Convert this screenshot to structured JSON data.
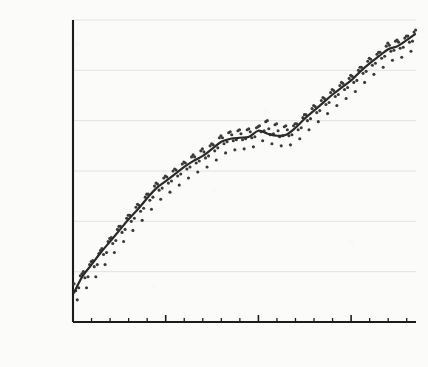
{
  "chart_data": {
    "type": "scatter",
    "title": "",
    "subtitle": "",
    "xlabel": "",
    "ylabel": "PARTS PER BILLION (PPB)",
    "xlim": [
      1983,
      2020
    ],
    "ylim": [
      1600,
      1900
    ],
    "xticks": [
      1983,
      1985,
      1987,
      1989,
      1991,
      1993,
      1995,
      1997,
      1999,
      2001,
      2003,
      2005,
      2007,
      2009,
      2011,
      2013,
      2015,
      2017,
      2019
    ],
    "xticklabels": [
      "1983",
      "",
      "",
      "",
      "",
      "1993",
      "",
      "",
      "",
      "",
      "2003",
      "",
      "",
      "",
      "",
      "2013",
      "",
      "",
      ""
    ],
    "yticks": [
      1600,
      1650,
      1700,
      1750,
      1800,
      1850,
      1900
    ],
    "yticklabels": [
      "1600",
      "1650",
      "1700",
      "1750",
      "1800",
      "1850",
      "1900"
    ],
    "grid": "horizontal",
    "legend": "none",
    "colors": {
      "background": "#fbfbfa",
      "axis": "#1c1c1c",
      "gridline": "#e2e2e2",
      "trend_line": "#2a2a2a",
      "scatter_point": "#3a3a3a",
      "tick_label": "#1c1c1c"
    },
    "series": [
      {
        "name": "Monthly mean",
        "kind": "scatter",
        "x": [
          1983.12,
          1983.29,
          1983.46,
          1983.62,
          1983.79,
          1983.96,
          1984.12,
          1984.29,
          1984.46,
          1984.62,
          1984.79,
          1984.96,
          1985.12,
          1985.29,
          1985.46,
          1985.62,
          1985.79,
          1985.96,
          1986.12,
          1986.29,
          1986.46,
          1986.62,
          1986.79,
          1986.96,
          1987.12,
          1987.29,
          1987.46,
          1987.62,
          1987.79,
          1987.96,
          1988.12,
          1988.29,
          1988.46,
          1988.62,
          1988.79,
          1988.96,
          1989.12,
          1989.29,
          1989.46,
          1989.62,
          1989.79,
          1989.96,
          1990.12,
          1990.29,
          1990.46,
          1990.62,
          1990.79,
          1990.96,
          1991.12,
          1991.29,
          1991.46,
          1991.62,
          1991.79,
          1991.96,
          1992.12,
          1992.29,
          1992.46,
          1992.62,
          1992.79,
          1992.96,
          1993.12,
          1993.29,
          1993.46,
          1993.62,
          1993.79,
          1993.96,
          1994.12,
          1994.29,
          1994.46,
          1994.62,
          1994.79,
          1994.96,
          1995.12,
          1995.29,
          1995.46,
          1995.62,
          1995.79,
          1995.96,
          1996.12,
          1996.29,
          1996.46,
          1996.62,
          1996.79,
          1996.96,
          1997.12,
          1997.29,
          1997.46,
          1997.62,
          1997.79,
          1997.96,
          1998.12,
          1998.29,
          1998.46,
          1998.62,
          1998.79,
          1998.96,
          1999.12,
          1999.29,
          1999.46,
          1999.62,
          1999.79,
          1999.96,
          2000.12,
          2000.29,
          2000.46,
          2000.62,
          2000.79,
          2000.96,
          2001.12,
          2001.29,
          2001.46,
          2001.62,
          2001.79,
          2001.96,
          2002.12,
          2002.29,
          2002.46,
          2002.62,
          2002.79,
          2002.96,
          2003.12,
          2003.29,
          2003.46,
          2003.62,
          2003.79,
          2003.96,
          2004.12,
          2004.29,
          2004.46,
          2004.62,
          2004.79,
          2004.96,
          2005.12,
          2005.29,
          2005.46,
          2005.62,
          2005.79,
          2005.96,
          2006.12,
          2006.29,
          2006.46,
          2006.62,
          2006.79,
          2006.96,
          2007.12,
          2007.29,
          2007.46,
          2007.62,
          2007.79,
          2007.96,
          2008.12,
          2008.29,
          2008.46,
          2008.62,
          2008.79,
          2008.96,
          2009.12,
          2009.29,
          2009.46,
          2009.62,
          2009.79,
          2009.96,
          2010.12,
          2010.29,
          2010.46,
          2010.62,
          2010.79,
          2010.96,
          2011.12,
          2011.29,
          2011.46,
          2011.62,
          2011.79,
          2011.96,
          2012.12,
          2012.29,
          2012.46,
          2012.62,
          2012.79,
          2012.96,
          2013.12,
          2013.29,
          2013.46,
          2013.62,
          2013.79,
          2013.96,
          2014.12,
          2014.29,
          2014.46,
          2014.62,
          2014.79,
          2014.96,
          2015.12,
          2015.29,
          2015.46,
          2015.62,
          2015.79,
          2015.96,
          2016.12,
          2016.29,
          2016.46,
          2016.62,
          2016.79,
          2016.96,
          2017.12,
          2017.29,
          2017.46,
          2017.62,
          2017.79,
          2017.96,
          2018.12,
          2018.29,
          2018.46,
          2018.62,
          2018.79,
          2018.96,
          2019.12,
          2019.29,
          2019.46,
          2019.62,
          2019.79,
          2019.96
        ],
        "y": [
          1638,
          1631,
          1622,
          1634,
          1646,
          1648,
          1650,
          1644,
          1634,
          1645,
          1657,
          1660,
          1661,
          1655,
          1645,
          1657,
          1668,
          1671,
          1673,
          1667,
          1657,
          1669,
          1680,
          1683,
          1684,
          1678,
          1669,
          1681,
          1692,
          1695,
          1695,
          1689,
          1680,
          1692,
          1703,
          1706,
          1706,
          1700,
          1691,
          1703,
          1714,
          1717,
          1716,
          1710,
          1701,
          1713,
          1724,
          1727,
          1727,
          1721,
          1712,
          1724,
          1735,
          1738,
          1737,
          1731,
          1722,
          1733,
          1743,
          1745,
          1744,
          1738,
          1729,
          1740,
          1750,
          1752,
          1751,
          1745,
          1736,
          1747,
          1757,
          1759,
          1758,
          1752,
          1743,
          1754,
          1764,
          1766,
          1764,
          1758,
          1749,
          1760,
          1770,
          1772,
          1769,
          1763,
          1754,
          1765,
          1775,
          1777,
          1776,
          1770,
          1761,
          1773,
          1783,
          1785,
          1783,
          1777,
          1768,
          1779,
          1788,
          1789,
          1786,
          1780,
          1771,
          1781,
          1790,
          1791,
          1787,
          1781,
          1772,
          1782,
          1791,
          1792,
          1789,
          1783,
          1774,
          1784,
          1793,
          1794,
          1795,
          1789,
          1780,
          1790,
          1799,
          1800,
          1792,
          1786,
          1777,
          1787,
          1796,
          1797,
          1790,
          1784,
          1775,
          1785,
          1794,
          1795,
          1791,
          1785,
          1776,
          1786,
          1795,
          1797,
          1797,
          1791,
          1782,
          1793,
          1803,
          1806,
          1806,
          1800,
          1791,
          1802,
          1812,
          1815,
          1814,
          1808,
          1799,
          1810,
          1820,
          1823,
          1822,
          1816,
          1807,
          1818,
          1828,
          1831,
          1830,
          1824,
          1815,
          1826,
          1835,
          1838,
          1837,
          1831,
          1822,
          1833,
          1842,
          1845,
          1844,
          1838,
          1829,
          1840,
          1850,
          1853,
          1853,
          1847,
          1838,
          1849,
          1859,
          1862,
          1861,
          1855,
          1846,
          1857,
          1866,
          1868,
          1868,
          1862,
          1853,
          1864,
          1874,
          1877,
          1875,
          1869,
          1860,
          1870,
          1879,
          1880,
          1878,
          1872,
          1863,
          1873,
          1882,
          1884,
          1884,
          1878,
          1869,
          1879,
          1888,
          1890
        ]
      },
      {
        "name": "Smoothed trend",
        "kind": "line",
        "x": [
          1983.1,
          1984,
          1985,
          1986,
          1987,
          1988,
          1989,
          1990,
          1991,
          1992,
          1993,
          1994,
          1995,
          1996,
          1997,
          1998,
          1999,
          2000,
          2001,
          2002,
          2003,
          2004,
          2005,
          2006,
          2007,
          2008,
          2009,
          2010,
          2011,
          2012,
          2013,
          2014,
          2015,
          2016,
          2017,
          2018,
          2019,
          2019.9
        ],
        "y": [
          1629,
          1645,
          1657,
          1669,
          1680,
          1691,
          1702,
          1712,
          1723,
          1733,
          1740,
          1747,
          1754,
          1760,
          1765,
          1772,
          1779,
          1782,
          1783,
          1784,
          1790,
          1787,
          1785,
          1786,
          1793,
          1802,
          1810,
          1818,
          1826,
          1833,
          1840,
          1849,
          1857,
          1864,
          1871,
          1874,
          1880,
          1886
        ]
      }
    ]
  }
}
